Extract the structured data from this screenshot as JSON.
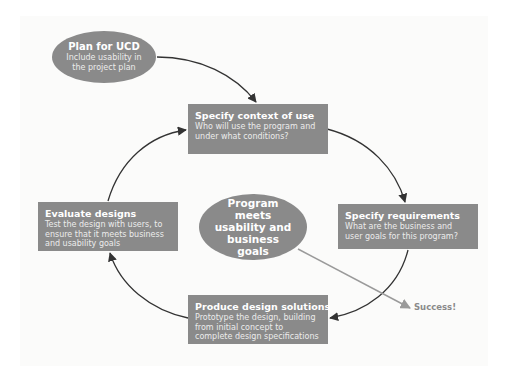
{
  "diagram": {
    "colors": {
      "node_fill": "#8a8a8a",
      "arrow": "#333333",
      "success_arrow": "#9a9a9a",
      "background": "#fbfbfa"
    },
    "start": {
      "title": "Plan for UCD",
      "desc": "Include usability in the project plan"
    },
    "center": {
      "title": "Program meets usability and business goals"
    },
    "steps": [
      {
        "title": "Specify context of use",
        "desc": "Who will use the program and under what conditions?"
      },
      {
        "title": "Specify requirements",
        "desc": "What are the business and user goals for this program?"
      },
      {
        "title": "Produce design solutions",
        "desc": "Prototype the design, building from initial concept to complete design specifications"
      },
      {
        "title": "Evaluate designs",
        "desc": "Test the design with users, to ensure that it meets business and usability goals"
      }
    ],
    "outcome": {
      "label": "Success!"
    }
  }
}
